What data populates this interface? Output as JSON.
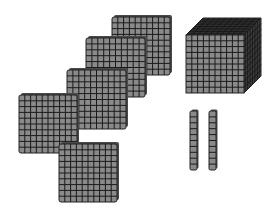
{
  "diagram": {
    "colors": {
      "fill": "#8a8a8a",
      "grid": "#1a1a1a",
      "edge": "#222222",
      "top": "#3a3a3a",
      "side": "#4a4a4a",
      "background": "#ffffff"
    },
    "blocks": {
      "thousands": [
        {
          "x": 186,
          "y": 35,
          "size": 58,
          "depth": 17
        }
      ],
      "hundreds": [
        {
          "x": 112,
          "y": 17,
          "size": 58
        },
        {
          "x": 86,
          "y": 38,
          "size": 59
        },
        {
          "x": 67,
          "y": 70,
          "size": 59
        },
        {
          "x": 19,
          "y": 95,
          "size": 58
        },
        {
          "x": 59,
          "y": 144,
          "size": 58
        }
      ],
      "tens": [
        {
          "x": 190,
          "y": 111,
          "w": 7,
          "h": 59
        },
        {
          "x": 209,
          "y": 111,
          "w": 7,
          "h": 59
        }
      ]
    },
    "counts": {
      "thousands": 1,
      "hundreds": 5,
      "tens": 2,
      "ones": 0
    }
  }
}
